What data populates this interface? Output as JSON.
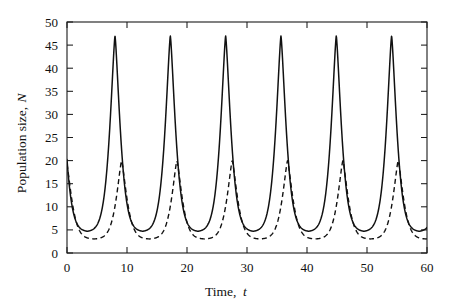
{
  "chart_data": {
    "type": "line",
    "title": "",
    "subtitle": "",
    "xlabel_text": "Time,",
    "xlabel_symbol": "t",
    "ylabel_text": "Population size,",
    "ylabel_symbol": "N",
    "xlim": [
      0,
      60
    ],
    "ylim": [
      0,
      50
    ],
    "xticks": [
      0,
      10,
      20,
      30,
      40,
      50,
      60
    ],
    "yticks": [
      0,
      5,
      10,
      15,
      20,
      25,
      30,
      35,
      40,
      45,
      50
    ],
    "xtick_labels": [
      "0",
      "10",
      "20",
      "30",
      "40",
      "50",
      "60"
    ],
    "ytick_labels": [
      "0",
      "5",
      "10",
      "15",
      "20",
      "25",
      "30",
      "35",
      "40",
      "45",
      "50"
    ],
    "grid": false,
    "legend_position": "none",
    "minor_ticks": false,
    "frame": "box",
    "annotations": [],
    "series": [
      {
        "name": "solid-curve",
        "style": "solid",
        "color": "#111111",
        "peak_value": 47,
        "trough_value": 4.6,
        "period": 9.22,
        "first_peak_t": 8.0,
        "start_value": 20,
        "peak_times": [
          8.0,
          17.2,
          26.4,
          35.6,
          44.9,
          54.1
        ],
        "trough_times": [
          2.6,
          11.8,
          21.0,
          30.2,
          39.5,
          48.7,
          57.9
        ],
        "peak_values": [
          47,
          47,
          47,
          47,
          47,
          47
        ],
        "trough_values": [
          4.6,
          4.6,
          4.6,
          4.6,
          4.6,
          4.6,
          4.6
        ]
      },
      {
        "name": "dashed-curve",
        "style": "dashed",
        "color": "#111111",
        "peak_value": 20,
        "trough_value": 3.0,
        "period": 9.22,
        "first_peak_t": 9.1,
        "start_value": 20,
        "peak_times": [
          9.1,
          18.3,
          27.5,
          36.7,
          46.0,
          55.2
        ],
        "trough_times": [
          5.3,
          14.5,
          23.7,
          32.9,
          42.2,
          51.4,
          60.0
        ],
        "peak_values": [
          20,
          20,
          20,
          20,
          20,
          20
        ],
        "trough_values": [
          3.0,
          3.0,
          3.0,
          3.0,
          3.0,
          3.0,
          3.0
        ]
      }
    ]
  },
  "geometry": {
    "plot_left": 67,
    "plot_right": 427,
    "plot_top": 22,
    "plot_bottom": 253
  }
}
